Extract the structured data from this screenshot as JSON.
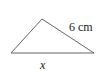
{
  "figure": {
    "shape": "triangle",
    "labels": {
      "right_side": "6 cm",
      "base": "x"
    },
    "colors": {
      "stroke": "#555555",
      "text": "#222222"
    }
  }
}
